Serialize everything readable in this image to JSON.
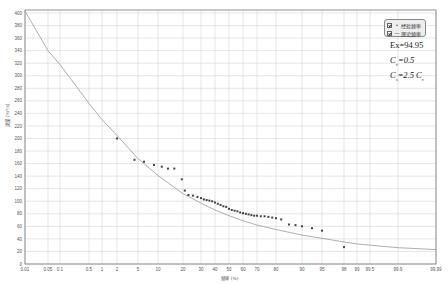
{
  "chart_data": {
    "type": "scatter",
    "title": "",
    "xlabel": "频率 (%)",
    "ylabel": "流量 (m³/s)",
    "x_scale": "probability (normal)",
    "xticks": [
      "0.01",
      "0.05",
      "0.1",
      "0.5",
      "1",
      "2",
      "5",
      "10",
      "20",
      "30",
      "40",
      "50",
      "60",
      "70",
      "80",
      "90",
      "95",
      "98",
      "99",
      "99.5",
      "99.9",
      "99.99"
    ],
    "yticks": [
      0,
      20,
      40,
      60,
      80,
      100,
      120,
      140,
      160,
      180,
      200,
      220,
      240,
      260,
      280,
      300,
      320,
      340,
      360,
      380,
      400
    ],
    "ylim": [
      0,
      400
    ],
    "xlim": [
      0.01,
      99.99
    ],
    "grid": true,
    "legend_position": "top-right",
    "legend": [
      "经验频率",
      "理论频率"
    ],
    "annotations": [
      "Ex=94.95",
      "Cv=0.5",
      "Cs=2.5 Cv"
    ],
    "series": [
      {
        "name": "经验频率",
        "kind": "points",
        "points": [
          [
            2.0,
            200
          ],
          [
            4.5,
            166
          ],
          [
            6.5,
            163
          ],
          [
            9.0,
            158
          ],
          [
            11.5,
            155
          ],
          [
            14.0,
            152
          ],
          [
            16.5,
            152
          ],
          [
            19.5,
            135
          ],
          [
            21.0,
            117
          ],
          [
            23.0,
            110
          ],
          [
            25.5,
            109
          ],
          [
            28.0,
            107
          ],
          [
            30.0,
            105
          ],
          [
            32.0,
            103
          ],
          [
            34.0,
            102
          ],
          [
            36.0,
            101
          ],
          [
            38.0,
            100
          ],
          [
            40.0,
            98
          ],
          [
            42.0,
            96
          ],
          [
            44.0,
            94
          ],
          [
            46.0,
            92
          ],
          [
            48.0,
            91
          ],
          [
            50.0,
            88
          ],
          [
            52.0,
            86
          ],
          [
            54.0,
            85
          ],
          [
            56.0,
            84
          ],
          [
            58.0,
            82
          ],
          [
            60.0,
            81
          ],
          [
            62.0,
            80
          ],
          [
            64.0,
            79
          ],
          [
            66.0,
            78
          ],
          [
            68.0,
            77
          ],
          [
            70.0,
            77
          ],
          [
            72.0,
            76
          ],
          [
            74.0,
            76
          ],
          [
            76.0,
            75
          ],
          [
            78.0,
            74
          ],
          [
            80.0,
            73
          ],
          [
            82.0,
            71
          ],
          [
            85.0,
            63
          ],
          [
            87.5,
            62
          ],
          [
            90.0,
            60
          ],
          [
            92.5,
            57
          ],
          [
            95.0,
            53
          ],
          [
            98.0,
            27
          ]
        ]
      },
      {
        "name": "理论频率",
        "kind": "line",
        "points": [
          [
            0.01,
            403
          ],
          [
            0.05,
            340
          ],
          [
            0.1,
            318
          ],
          [
            0.5,
            256
          ],
          [
            1,
            230
          ],
          [
            2,
            205
          ],
          [
            5,
            168
          ],
          [
            10,
            141
          ],
          [
            20,
            112
          ],
          [
            30,
            97
          ],
          [
            40,
            86
          ],
          [
            50,
            77
          ],
          [
            60,
            69
          ],
          [
            70,
            62
          ],
          [
            80,
            55
          ],
          [
            90,
            46
          ],
          [
            95,
            41
          ],
          [
            98,
            35
          ],
          [
            99,
            32
          ],
          [
            99.5,
            30
          ],
          [
            99.9,
            26
          ],
          [
            99.99,
            23
          ]
        ]
      }
    ]
  },
  "legend": {
    "items": [
      {
        "label": "经验频率",
        "symbol": "•"
      },
      {
        "label": "理论频率",
        "symbol": "—"
      }
    ]
  },
  "annotations": {
    "ex": "Ex=94.95",
    "cv_prefix": "C",
    "cv_sub": "v",
    "cv_suffix": "=0.5",
    "cs_prefix": "C",
    "cs_sub": "s",
    "cs_mid": "=2.5 C",
    "cs_sub2": "v"
  }
}
